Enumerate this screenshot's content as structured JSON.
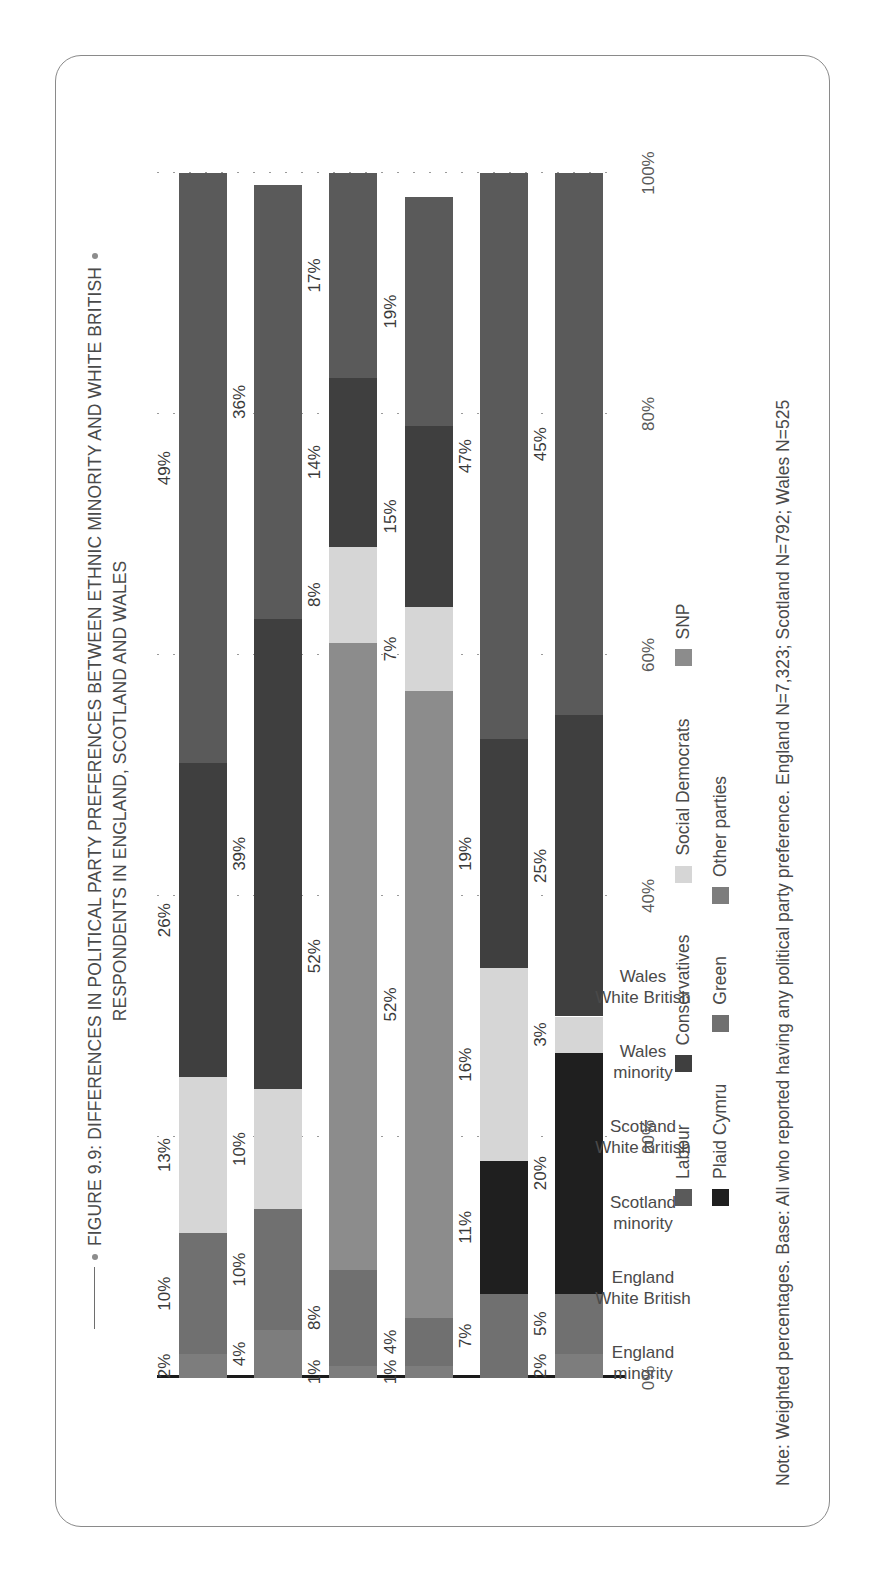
{
  "figure": {
    "title_line1": "FIGURE 9.9: DIFFERENCES IN POLITICAL PARTY PREFERENCES BETWEEN ETHNIC MINORITY AND WHITE BRITISH",
    "title_line2": "RESPONDENTS IN ENGLAND, SCOTLAND AND WALES",
    "note": "Note: Weighted percentages. Base: All who reported having any political party preference. England N=7,323; Scotland N=792; Wales N=525"
  },
  "chart_data": {
    "type": "bar",
    "orientation": "horizontal-stacked",
    "title": "FIGURE 9.9: DIFFERENCES IN POLITICAL PARTY PREFERENCES BETWEEN ETHNIC MINORITY AND WHITE BRITISH RESPONDENTS IN ENGLAND, SCOTLAND AND WALES",
    "xlabel": "",
    "ylabel": "",
    "ylim": [
      0,
      100
    ],
    "yticks": [
      "0%",
      "20%",
      "40%",
      "60%",
      "80%",
      "100%"
    ],
    "ytick_values": [
      0,
      20,
      40,
      60,
      80,
      100
    ],
    "grid": true,
    "legend_position": "bottom",
    "categories": [
      "England\nminority",
      "England\nWhite British",
      "Scotland\nminority",
      "Scotland\nWhite British",
      "Wales\nminority",
      "Wales\nWhite British"
    ],
    "category_lines": [
      [
        "England",
        "minority"
      ],
      [
        "England",
        "White British"
      ],
      [
        "Scotland",
        "minority"
      ],
      [
        "Scotland",
        "White British"
      ],
      [
        "Wales",
        "minority"
      ],
      [
        "Wales",
        "White British"
      ]
    ],
    "series": [
      {
        "name": "Labour",
        "color": "#5a5a5a",
        "values": [
          49,
          36,
          17,
          19,
          47,
          45
        ]
      },
      {
        "name": "Conservatives",
        "color": "#3f3f3f",
        "values": [
          26,
          39,
          14,
          15,
          19,
          25
        ]
      },
      {
        "name": "Social Democrats",
        "color": "#d6d6d6",
        "values": [
          13,
          10,
          8,
          7,
          16,
          3
        ]
      },
      {
        "name": "SNP",
        "color": "#8c8c8c",
        "values": [
          0,
          0,
          52,
          52,
          0,
          0
        ]
      },
      {
        "name": "Plaid Cymru",
        "color": "#1f1f1f",
        "values": [
          0,
          0,
          0,
          0,
          11,
          20
        ]
      },
      {
        "name": "Green",
        "color": "#707070",
        "values": [
          10,
          10,
          8,
          4,
          7,
          5
        ]
      },
      {
        "name": "Other parties",
        "color": "#7d7d7d",
        "values": [
          2,
          4,
          1,
          1,
          0,
          2
        ]
      }
    ],
    "stacks": [
      {
        "category": "England minority",
        "segments": [
          {
            "party": "Other parties",
            "value": 2,
            "label": "2%",
            "color": "#7d7d7d"
          },
          {
            "party": "Green",
            "value": 10,
            "label": "10%",
            "color": "#707070"
          },
          {
            "party": "Social Democrats",
            "value": 13,
            "label": "13%",
            "color": "#d6d6d6"
          },
          {
            "party": "Conservatives",
            "value": 26,
            "label": "26%",
            "color": "#3f3f3f"
          },
          {
            "party": "Labour",
            "value": 49,
            "label": "49%",
            "color": "#5a5a5a"
          }
        ]
      },
      {
        "category": "England White British",
        "segments": [
          {
            "party": "Other parties",
            "value": 4,
            "label": "4%",
            "color": "#7d7d7d"
          },
          {
            "party": "Green",
            "value": 10,
            "label": "10%",
            "color": "#707070"
          },
          {
            "party": "Social Democrats",
            "value": 10,
            "label": "10%",
            "color": "#d6d6d6"
          },
          {
            "party": "Conservatives",
            "value": 39,
            "label": "39%",
            "color": "#3f3f3f"
          },
          {
            "party": "Labour",
            "value": 36,
            "label": "36%",
            "color": "#5a5a5a"
          }
        ]
      },
      {
        "category": "Scotland minority",
        "segments": [
          {
            "party": "Other parties",
            "value": 1,
            "label": "1%",
            "color": "#7d7d7d"
          },
          {
            "party": "Green",
            "value": 8,
            "label": "8%",
            "color": "#707070"
          },
          {
            "party": "SNP",
            "value": 52,
            "label": "52%",
            "color": "#8c8c8c"
          },
          {
            "party": "Social Democrats",
            "value": 8,
            "label": "8%",
            "color": "#d6d6d6"
          },
          {
            "party": "Conservatives",
            "value": 14,
            "label": "14%",
            "color": "#3f3f3f"
          },
          {
            "party": "Labour",
            "value": 17,
            "label": "17%",
            "color": "#5a5a5a"
          }
        ]
      },
      {
        "category": "Scotland White British",
        "segments": [
          {
            "party": "Other parties",
            "value": 1,
            "label": "1%",
            "color": "#7d7d7d"
          },
          {
            "party": "Green",
            "value": 4,
            "label": "4%",
            "color": "#707070"
          },
          {
            "party": "SNP",
            "value": 52,
            "label": "52%",
            "color": "#8c8c8c"
          },
          {
            "party": "Social Democrats",
            "value": 7,
            "label": "7%",
            "color": "#d6d6d6"
          },
          {
            "party": "Conservatives",
            "value": 15,
            "label": "15%",
            "color": "#3f3f3f"
          },
          {
            "party": "Labour",
            "value": 19,
            "label": "19%",
            "color": "#5a5a5a"
          }
        ]
      },
      {
        "category": "Wales minority",
        "segments": [
          {
            "party": "Green",
            "value": 7,
            "label": "7%",
            "color": "#707070"
          },
          {
            "party": "Plaid Cymru",
            "value": 11,
            "label": "11%",
            "color": "#1f1f1f"
          },
          {
            "party": "Social Democrats",
            "value": 16,
            "label": "16%",
            "color": "#d6d6d6"
          },
          {
            "party": "Conservatives",
            "value": 19,
            "label": "19%",
            "color": "#3f3f3f"
          },
          {
            "party": "Labour",
            "value": 47,
            "label": "47%",
            "color": "#5a5a5a"
          }
        ]
      },
      {
        "category": "Wales White British",
        "segments": [
          {
            "party": "Other parties",
            "value": 2,
            "label": "2%",
            "color": "#7d7d7d"
          },
          {
            "party": "Green",
            "value": 5,
            "label": "5%",
            "color": "#707070"
          },
          {
            "party": "Plaid Cymru",
            "value": 20,
            "label": "20%",
            "color": "#1f1f1f"
          },
          {
            "party": "Social Democrats",
            "value": 3,
            "label": "3%",
            "color": "#d6d6d6"
          },
          {
            "party": "Conservatives",
            "value": 25,
            "label": "25%",
            "color": "#3f3f3f"
          },
          {
            "party": "Labour",
            "value": 45,
            "label": "45%",
            "color": "#5a5a5a"
          }
        ]
      }
    ]
  },
  "legend": {
    "rows": [
      [
        {
          "label": "Labour",
          "color": "#5a5a5a"
        },
        {
          "label": "Conservatives",
          "color": "#3f3f3f"
        },
        {
          "label": "Social Democrats",
          "color": "#d6d6d6"
        },
        {
          "label": "SNP",
          "color": "#8c8c8c"
        }
      ],
      [
        {
          "label": "Plaid Cymru",
          "color": "#1f1f1f"
        },
        {
          "label": "Green",
          "color": "#707070"
        },
        {
          "label": "Other parties",
          "color": "#7d7d7d"
        }
      ]
    ]
  }
}
